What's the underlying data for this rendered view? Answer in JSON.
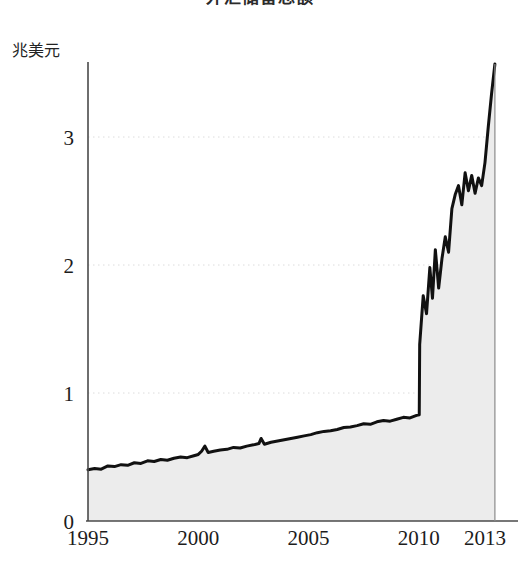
{
  "chart_data": {
    "type": "area",
    "title": "外汇储备总额",
    "subtitle": "",
    "xlabel": "",
    "ylabel": "兆美元",
    "y_unit_label": "兆美元",
    "xlim": [
      1995,
      2013.5
    ],
    "ylim": [
      0,
      3.8
    ],
    "yticks": [
      0,
      1,
      2,
      3
    ],
    "ytick_labels": [
      "0",
      "1",
      "2",
      "3"
    ],
    "xticks": [
      1995,
      2000,
      2005,
      2010,
      2013
    ],
    "xtick_labels": [
      "1995",
      "2000",
      "2005",
      "2010",
      "2013"
    ],
    "grid": "horizontal-dotted",
    "legend": "none",
    "line_color": "#111111",
    "fill_color": "#ececec",
    "axis_color": "#4a4a4a",
    "grid_color": "#dcdcdc",
    "series": [
      {
        "name": "外汇储备总额",
        "unit": "兆美元",
        "x": [
          1995.0,
          1995.3,
          1995.6,
          1995.9,
          1996.2,
          1996.5,
          1996.8,
          1997.1,
          1997.4,
          1997.7,
          1998.0,
          1998.3,
          1998.6,
          1998.9,
          1999.2,
          1999.5,
          1999.8,
          2000.0,
          2000.15,
          2000.3,
          2000.45,
          2000.7,
          2001.0,
          2001.3,
          2001.6,
          2001.9,
          2002.2,
          2002.5,
          2002.75,
          2002.85,
          2003.0,
          2003.3,
          2003.6,
          2003.9,
          2004.2,
          2004.5,
          2004.8,
          2005.1,
          2005.4,
          2005.7,
          2006.0,
          2006.3,
          2006.6,
          2006.9,
          2007.2,
          2007.5,
          2007.8,
          2008.1,
          2008.4,
          2008.7,
          2009.0,
          2009.3,
          2009.6,
          2009.9,
          2010.02,
          2010.04,
          2010.2,
          2010.35,
          2010.5,
          2010.62,
          2010.75,
          2010.9,
          2011.05,
          2011.2,
          2011.35,
          2011.5,
          2011.65,
          2011.8,
          2011.95,
          2012.1,
          2012.25,
          2012.4,
          2012.55,
          2012.7,
          2012.85,
          2013.0,
          2013.15,
          2013.3,
          2013.45
        ],
        "values": [
          0.4,
          0.41,
          0.405,
          0.43,
          0.425,
          0.44,
          0.435,
          0.455,
          0.45,
          0.47,
          0.465,
          0.48,
          0.475,
          0.49,
          0.5,
          0.495,
          0.51,
          0.52,
          0.545,
          0.585,
          0.535,
          0.545,
          0.555,
          0.56,
          0.575,
          0.57,
          0.585,
          0.595,
          0.605,
          0.645,
          0.6,
          0.615,
          0.625,
          0.635,
          0.645,
          0.655,
          0.665,
          0.675,
          0.69,
          0.7,
          0.705,
          0.715,
          0.73,
          0.735,
          0.745,
          0.76,
          0.755,
          0.775,
          0.785,
          0.78,
          0.795,
          0.81,
          0.805,
          0.825,
          0.83,
          1.38,
          1.76,
          1.62,
          1.98,
          1.74,
          2.12,
          1.82,
          2.05,
          2.22,
          2.1,
          2.44,
          2.55,
          2.62,
          2.47,
          2.72,
          2.58,
          2.7,
          2.56,
          2.68,
          2.62,
          2.8,
          3.08,
          3.34,
          3.57
        ]
      }
    ],
    "annotations": {
      "start_value": 0.4,
      "start_year": 1995,
      "pre_jump_value": 0.83,
      "jump_year": 2010,
      "post_jump_value": 1.76,
      "peak_value": 3.57,
      "peak_year": 2013.45
    }
  }
}
